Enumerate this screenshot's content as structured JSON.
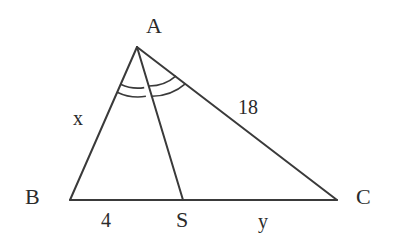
{
  "figure": {
    "stroke_color": "#3a3a3a",
    "text_color": "#2b2b2b",
    "background_color": "#ffffff",
    "vertices": {
      "A": {
        "label": "A",
        "x": 137,
        "y": 47
      },
      "B": {
        "label": "B",
        "x": 70,
        "y": 200
      },
      "C": {
        "label": "C",
        "x": 337,
        "y": 200
      },
      "S": {
        "label": "S",
        "x": 183,
        "y": 200
      }
    },
    "side_labels": {
      "AB": "x",
      "AC": "18",
      "BS": "4",
      "SC": "y"
    },
    "angle_marks": {
      "BAS": {
        "arcs": 2,
        "name": "double-arc"
      },
      "SAC": {
        "arcs": 2,
        "name": "double-arc"
      }
    }
  }
}
